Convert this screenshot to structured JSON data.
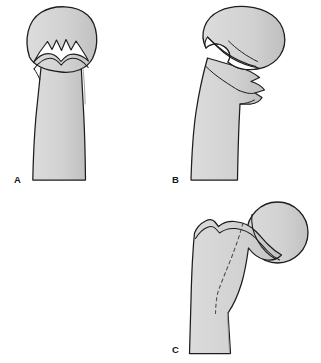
{
  "figure": {
    "view": "anteroposterior line drawing",
    "background_color": "#ffffff",
    "bone_fill_color": "#d2d2d2",
    "bone_fill_shadow_color": "#c2c2c2",
    "outline_color": "#1d1d1f",
    "gap_fill_color": "#ffffff",
    "dashed_line_color": "#4a4a4c",
    "panel_count": 3
  },
  "panels": [
    {
      "id": "A",
      "label": "A",
      "label_position": {
        "x": 14,
        "y": 183
      },
      "name": "panel-a",
      "description": "Impacted comminuted fracture of the proximal femur with interdigitating zigzag fracture gap between the rounded head and the shaft",
      "fracture_type": "comminuted impacted",
      "fracture_line_style": "solid-with-gap",
      "displacement": "none",
      "head_shape": "dome",
      "head_orientation": "superior, aligned with shaft"
    },
    {
      "id": "B",
      "label": "B",
      "label_position": {
        "x": 172,
        "y": 183
      },
      "name": "panel-b",
      "description": "Displaced fracture with the femoral head tilted laterally over the neck, a wide white fracture gap beneath the head and a stepped lateral cortical fragment",
      "fracture_type": "displaced with lateral butterfly fragment",
      "fracture_line_style": "solid-with-gap",
      "displacement": "lateral tilt of head",
      "head_shape": "oblique oval",
      "head_orientation": "tilted laterally"
    },
    {
      "id": "C",
      "label": "C",
      "label_position": {
        "x": 172,
        "y": 353
      },
      "name": "panel-c",
      "description": "Intertrochanteric region with round femoral head on a short neck, notched greater trochanter and an oblique dashed fracture line running through the shaft",
      "fracture_type": "intertrochanteric, occult",
      "fracture_line_style": "dashed",
      "displacement": "none",
      "head_shape": "round",
      "head_orientation": "medial, on neck"
    }
  ],
  "legend": {
    "solid_line_meaning": "cortical outline",
    "dashed_line_meaning": "fracture line"
  }
}
